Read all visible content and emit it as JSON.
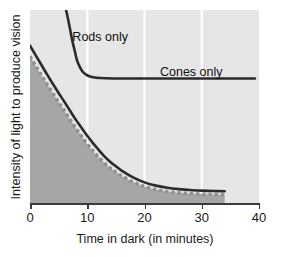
{
  "chart_data": {
    "type": "line",
    "title": "",
    "xlabel": "Time in dark (in minutes)",
    "ylabel": "Intensity of light to produce vision",
    "xlim": [
      0,
      40
    ],
    "ylim": [
      0,
      1
    ],
    "xticks": [
      0,
      10,
      20,
      30,
      40
    ],
    "xticklabels": [
      "0",
      "10",
      "20",
      "30",
      "40"
    ],
    "yticks": [],
    "yticklabels": [],
    "grid": "vertical-white-gridlines-at-10-20-30",
    "legend": "inline-curve-labels",
    "annotations": [
      {
        "text": "Rods only",
        "x": 7.4,
        "y": 0.855
      },
      {
        "text": "Cones only",
        "x": 22.7,
        "y": 0.675
      }
    ],
    "series": [
      {
        "name": "Cones only",
        "style": "solid-dark",
        "x": [
          6.3,
          6.6,
          7.0,
          7.4,
          7.8,
          8.2,
          8.7,
          9.2,
          9.8,
          10.5,
          11.3,
          12.2,
          13.2,
          14.5,
          16.0,
          18.0,
          21.0,
          25.0,
          29.0,
          33.0,
          39.3
        ],
        "y": [
          1.0,
          0.96,
          0.9,
          0.84,
          0.79,
          0.74,
          0.705,
          0.68,
          0.665,
          0.655,
          0.65,
          0.648,
          0.646,
          0.645,
          0.645,
          0.645,
          0.645,
          0.645,
          0.645,
          0.645,
          0.645
        ]
      },
      {
        "name": "Rods only",
        "style": "solid-dark",
        "x": [
          0,
          1,
          2,
          3,
          4,
          5,
          6,
          7,
          8,
          9,
          10,
          11,
          12,
          13,
          14,
          15,
          16,
          18,
          20,
          22,
          24,
          26,
          28,
          30,
          32,
          34
        ],
        "y": [
          0.815,
          0.765,
          0.715,
          0.665,
          0.617,
          0.57,
          0.525,
          0.478,
          0.432,
          0.39,
          0.348,
          0.31,
          0.275,
          0.242,
          0.214,
          0.19,
          0.168,
          0.133,
          0.107,
          0.09,
          0.079,
          0.072,
          0.067,
          0.064,
          0.062,
          0.061
        ]
      },
      {
        "name": "Dark adaptation threshold",
        "style": "dotted-gray",
        "x": [
          0,
          1,
          2,
          3,
          4,
          5,
          6,
          7,
          8,
          9,
          10,
          11,
          12,
          13,
          14,
          15,
          16,
          18,
          20,
          22,
          24,
          26,
          28,
          30,
          32,
          34
        ],
        "y": [
          0.76,
          0.71,
          0.662,
          0.615,
          0.568,
          0.523,
          0.478,
          0.432,
          0.388,
          0.346,
          0.306,
          0.27,
          0.237,
          0.207,
          0.182,
          0.16,
          0.14,
          0.109,
          0.086,
          0.07,
          0.06,
          0.053,
          0.049,
          0.046,
          0.044,
          0.043
        ]
      }
    ],
    "shaded_region": {
      "name": "adapted-region",
      "color": "#a6a6a6",
      "from_x": 0,
      "to_x": 34
    },
    "colors": {
      "plot_background": "#e6e6e6",
      "shade": "#a6a6a6",
      "curve": "#2b2b2b",
      "dotted_curve": "#8a8a8a",
      "gridline": "#ffffff",
      "axis": "#3a3a3a",
      "text": "#1a1a1a"
    }
  },
  "axis": {
    "x_title": "Time in dark (in minutes)",
    "y_title": "Intensity of light to produce vision",
    "ticks": [
      {
        "label": "0"
      },
      {
        "label": "10"
      },
      {
        "label": "20"
      },
      {
        "label": "30"
      },
      {
        "label": "40"
      }
    ]
  },
  "labels": {
    "rods": "Rods only",
    "cones": "Cones only"
  }
}
